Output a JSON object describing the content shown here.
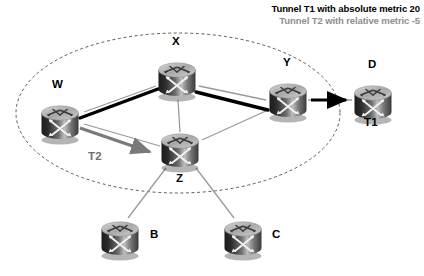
{
  "diagram": {
    "title_region": "mpls-te-tunnel-topology",
    "background": "#ffffff",
    "legend": {
      "t1": "Tunnel T1 with absolute metric 20",
      "t2": "Tunnel T2 with relative metric -5",
      "t1_color": "#000000",
      "t2_color": "#8e8e8e"
    },
    "domain_boundary": {
      "shape": "dashed-ellipse",
      "color": "#5a5a5a",
      "cx": 178,
      "cy": 113,
      "rx": 162,
      "ry": 80
    },
    "routers": [
      {
        "id": "W",
        "label": "W",
        "x": 35,
        "y": 96,
        "label_x": 52,
        "label_y": 78,
        "icon": "router-icon"
      },
      {
        "id": "X",
        "label": "X",
        "x": 152,
        "y": 53,
        "label_x": 172,
        "label_y": 35,
        "icon": "router-icon"
      },
      {
        "id": "Y",
        "label": "Y",
        "x": 263,
        "y": 74,
        "label_x": 283,
        "label_y": 56,
        "icon": "router-icon"
      },
      {
        "id": "D",
        "label": "D",
        "x": 348,
        "y": 76,
        "label_x": 368,
        "label_y": 58,
        "icon": "router-icon"
      },
      {
        "id": "Z",
        "label": "Z",
        "x": 155,
        "y": 124,
        "label_x": 176,
        "label_y": 172,
        "icon": "router-icon"
      },
      {
        "id": "B",
        "label": "B",
        "x": 95,
        "y": 212,
        "label_x": 150,
        "label_y": 228,
        "icon": "router-icon"
      },
      {
        "id": "C",
        "label": "C",
        "x": 218,
        "y": 212,
        "label_x": 272,
        "label_y": 228,
        "icon": "router-icon"
      }
    ],
    "links": [
      {
        "from": "W",
        "to": "X",
        "style": "thin-gray"
      },
      {
        "from": "X",
        "to": "Y",
        "style": "thin-gray"
      },
      {
        "from": "W",
        "to": "Z",
        "style": "thin-gray"
      },
      {
        "from": "X",
        "to": "Z",
        "style": "thin-gray"
      },
      {
        "from": "Z",
        "to": "Y",
        "style": "thin-gray"
      },
      {
        "from": "Y",
        "to": "D",
        "style": "thin-gray"
      },
      {
        "from": "Z",
        "to": "B",
        "style": "thin-gray"
      },
      {
        "from": "Z",
        "to": "C",
        "style": "thin-gray"
      }
    ],
    "tunnels": [
      {
        "id": "T1",
        "label": "T1",
        "label_x": 364,
        "label_y": 116,
        "color": "#000000",
        "style": "thick-black-arrow",
        "path": "W -> X -> Y -> D"
      },
      {
        "id": "T2",
        "label": "T2",
        "label_x": 88,
        "label_y": 150,
        "color": "#7a7a7a",
        "style": "thick-gray-arrow",
        "path": "W -> Z"
      }
    ]
  }
}
